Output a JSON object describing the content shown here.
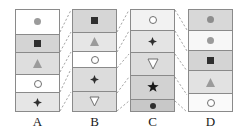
{
  "figure": {
    "type": "segmented-column-diagram",
    "width": 243,
    "height": 134,
    "background": "#ffffff",
    "border_color": "#8a8a8a",
    "connector_style": "dashed",
    "connector_color": "#9a9a9a"
  },
  "palette": {
    "white": "#ffffff",
    "very_light_gray": "#f2f2f2",
    "light_gray": "#e8e8e8",
    "gray": "#dcdcdc",
    "mid_gray": "#d0d0d0",
    "dark_gray": "#c4c4c4",
    "symbol_dark": "#2a2a2a",
    "symbol_gray": "#9b9b9b",
    "symbol_outline": "#6f6f6f"
  },
  "columns": [
    {
      "id": "A",
      "label": "A",
      "x": 15,
      "y": 9,
      "width": 45,
      "height": 103,
      "cells": [
        {
          "index": 1,
          "height": 25,
          "bg": "#ffffff",
          "symbol": "filled-circle",
          "symbol_color": "#9b9b9b",
          "size": 7
        },
        {
          "index": 2,
          "height": 19,
          "bg": "#d4d4d4",
          "symbol": "filled-square",
          "symbol_color": "#2f2f2f",
          "size": 7
        },
        {
          "index": 3,
          "height": 22,
          "bg": "#dedede",
          "symbol": "filled-triangle-up",
          "symbol_color": "#9b9b9b",
          "size": 9
        },
        {
          "index": 4,
          "height": 19,
          "bg": "#ffffff",
          "symbol": "open-circle",
          "symbol_color": "#6f6f6f",
          "size": 8
        },
        {
          "index": 5,
          "height": 18,
          "bg": "#e6e6e6",
          "symbol": "filled-diamond-star",
          "symbol_color": "#2f2f2f",
          "size": 9
        }
      ]
    },
    {
      "id": "B",
      "label": "B",
      "x": 72,
      "y": 9,
      "width": 45,
      "height": 103,
      "cells": [
        {
          "index": 1,
          "height": 23,
          "bg": "#d6d6d6",
          "symbol": "filled-square",
          "symbol_color": "#2f2f2f",
          "size": 7
        },
        {
          "index": 2,
          "height": 20,
          "bg": "#e6e6e6",
          "symbol": "filled-triangle-up",
          "symbol_color": "#9b9b9b",
          "size": 9
        },
        {
          "index": 3,
          "height": 16,
          "bg": "#ffffff",
          "symbol": "open-circle",
          "symbol_color": "#6f6f6f",
          "size": 8
        },
        {
          "index": 4,
          "height": 25,
          "bg": "#dcdcdc",
          "symbol": "filled-diamond-star",
          "symbol_color": "#2f2f2f",
          "size": 9
        },
        {
          "index": 5,
          "height": 19,
          "bg": "#dcdcdc",
          "symbol": "open-triangle-down",
          "symbol_color": "#6f6f6f",
          "size": 9
        }
      ]
    },
    {
      "id": "C",
      "label": "C",
      "x": 130,
      "y": 9,
      "width": 45,
      "height": 103,
      "cells": [
        {
          "index": 1,
          "height": 21,
          "bg": "#f2f2f2",
          "symbol": "open-circle",
          "symbol_color": "#6f6f6f",
          "size": 8
        },
        {
          "index": 2,
          "height": 23,
          "bg": "#e4e4e4",
          "symbol": "filled-diamond-star",
          "symbol_color": "#2f2f2f",
          "size": 9
        },
        {
          "index": 3,
          "height": 23,
          "bg": "#dcdcdc",
          "symbol": "open-triangle-down",
          "symbol_color": "#6f6f6f",
          "size": 10
        },
        {
          "index": 4,
          "height": 25,
          "bg": "#d2d2d2",
          "symbol": "filled-star",
          "symbol_color": "#1a1a1a",
          "size": 12
        },
        {
          "index": 5,
          "height": 11,
          "bg": "#c8c8c8",
          "symbol": "filled-circle",
          "symbol_color": "#2f2f2f",
          "size": 6
        }
      ]
    },
    {
      "id": "D",
      "label": "D",
      "x": 188,
      "y": 9,
      "width": 45,
      "height": 103,
      "cells": [
        {
          "index": 1,
          "height": 21,
          "bg": "#d8d8d8",
          "symbol": "filled-circle",
          "symbol_color": "#8d8d8d",
          "size": 7
        },
        {
          "index": 2,
          "height": 21,
          "bg": "#f7f7f7",
          "symbol": "filled-circle",
          "symbol_color": "#9b9b9b",
          "size": 7
        },
        {
          "index": 3,
          "height": 20,
          "bg": "#d4d4d4",
          "symbol": "filled-square",
          "symbol_color": "#2f2f2f",
          "size": 7
        },
        {
          "index": 4,
          "height": 24,
          "bg": "#e2e2e2",
          "symbol": "filled-triangle-up",
          "symbol_color": "#9b9b9b",
          "size": 9
        },
        {
          "index": 5,
          "height": 17,
          "bg": "#fafafa",
          "symbol": "open-circle",
          "symbol_color": "#6f6f6f",
          "size": 8
        }
      ]
    }
  ],
  "connectors": [
    {
      "from": "A",
      "to": "B",
      "lines": [
        {
          "x1": 60,
          "y1": 32,
          "x2": 71,
          "y2": 10
        },
        {
          "x1": 60,
          "y1": 52,
          "x2": 71,
          "y2": 32
        },
        {
          "x1": 60,
          "y1": 72,
          "x2": 71,
          "y2": 52
        },
        {
          "x1": 60,
          "y1": 92,
          "x2": 71,
          "y2": 69
        },
        {
          "x1": 60,
          "y1": 111,
          "x2": 71,
          "y2": 92
        }
      ]
    },
    {
      "from": "B",
      "to": "C",
      "lines": [
        {
          "x1": 117,
          "y1": 32,
          "x2": 129,
          "y2": 10
        },
        {
          "x1": 117,
          "y1": 52,
          "x2": 129,
          "y2": 31
        },
        {
          "x1": 117,
          "y1": 68,
          "x2": 129,
          "y2": 54
        },
        {
          "x1": 117,
          "y1": 93,
          "x2": 129,
          "y2": 77
        },
        {
          "x1": 117,
          "y1": 111,
          "x2": 129,
          "y2": 101
        }
      ]
    },
    {
      "from": "C",
      "to": "D",
      "lines": [
        {
          "x1": 175,
          "y1": 10,
          "x2": 187,
          "y2": 30
        },
        {
          "x1": 175,
          "y1": 31,
          "x2": 187,
          "y2": 51
        },
        {
          "x1": 175,
          "y1": 54,
          "x2": 187,
          "y2": 71
        },
        {
          "x1": 175,
          "y1": 77,
          "x2": 187,
          "y2": 95
        },
        {
          "x1": 175,
          "y1": 101,
          "x2": 187,
          "y2": 112
        }
      ]
    }
  ],
  "labels": {
    "y": 114,
    "items": [
      {
        "id": "A",
        "text": "A"
      },
      {
        "id": "B",
        "text": "B"
      },
      {
        "id": "C",
        "text": "C"
      },
      {
        "id": "D",
        "text": "D"
      }
    ]
  }
}
